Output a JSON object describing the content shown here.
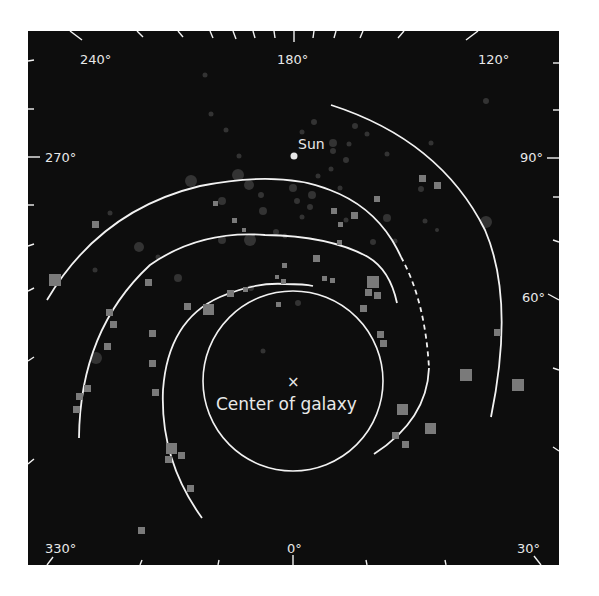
{
  "diagram": {
    "colors": {
      "background": "#0d0d0d",
      "page": "#ffffff",
      "arm": "#f2f2f2",
      "label": "#e8e8e8",
      "square_marker": "#7a7a7a",
      "circle_marker": "#3a3a3a",
      "sun": "#e6e6e6"
    },
    "labels": {
      "sun": "Sun",
      "center_mark": "×",
      "center": "Center of galaxy"
    },
    "degree_labels": [
      {
        "text": "240°",
        "x": 80,
        "y": 64
      },
      {
        "text": "180°",
        "x": 277,
        "y": 64
      },
      {
        "text": "120°",
        "x": 478,
        "y": 64
      },
      {
        "text": "270°",
        "x": 45,
        "y": 162
      },
      {
        "text": "90°",
        "x": 488,
        "y": 162
      },
      {
        "text": "60°",
        "x": 493,
        "y": 302
      },
      {
        "text": "330°",
        "x": 45,
        "y": 553
      },
      {
        "text": "0°",
        "x": 287,
        "y": 553
      },
      {
        "text": "30°",
        "x": 517,
        "y": 553
      }
    ],
    "center": {
      "x": 293,
      "y": 381,
      "radius": 90
    },
    "sun": {
      "x": 294,
      "y": 156,
      "r": 3.5
    }
  }
}
